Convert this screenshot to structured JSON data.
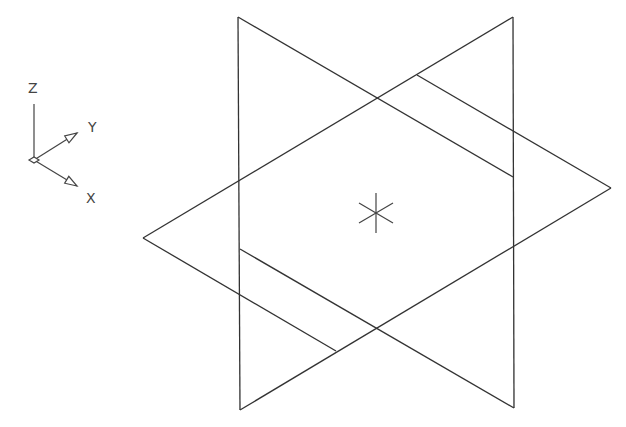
{
  "viewport": {
    "background": "#ffffff",
    "line_color": "#333333",
    "width": 626,
    "height": 427
  },
  "ucs_icon": {
    "labels": {
      "z": "Z",
      "y": "Y",
      "x": "X"
    },
    "origin": [
      34,
      160
    ],
    "z_end": [
      34,
      104
    ],
    "y_end": [
      77,
      133
    ],
    "x_end": [
      77,
      186
    ],
    "z_label_pos": [
      28,
      93
    ],
    "y_label_pos": [
      88,
      132
    ],
    "x_label_pos": [
      86,
      203
    ]
  },
  "drawing": {
    "verticals": [
      {
        "name": "left-vertical-edge",
        "x1": 238,
        "y1": 17,
        "x2": 240,
        "y2": 410
      },
      {
        "name": "right-vertical-edge",
        "x1": 513,
        "y1": 17,
        "x2": 514,
        "y2": 408
      }
    ],
    "edges": [
      {
        "name": "edge-top-left-to-right-vertical",
        "x1": 238,
        "y1": 17,
        "x2": 513,
        "y2": 177
      },
      {
        "name": "edge-inner-upper-to-right-vertex",
        "x1": 417,
        "y1": 75,
        "x2": 611,
        "y2": 188
      },
      {
        "name": "edge-left-vertex-to-top-right",
        "x1": 143,
        "y1": 238,
        "x2": 513,
        "y2": 17
      },
      {
        "name": "edge-right-vertex-to-bottom-left",
        "x1": 611,
        "y1": 188,
        "x2": 240,
        "y2": 410
      },
      {
        "name": "edge-left-vertex-to-inner-lower",
        "x1": 143,
        "y1": 238,
        "x2": 336,
        "y2": 351
      },
      {
        "name": "edge-left-vertical-to-bottom-right",
        "x1": 240,
        "y1": 249,
        "x2": 514,
        "y2": 408
      }
    ],
    "center_marker": {
      "cx": 376,
      "cy": 213,
      "half_height": 20,
      "diag_dx": 17,
      "diag_dy": 10
    }
  }
}
